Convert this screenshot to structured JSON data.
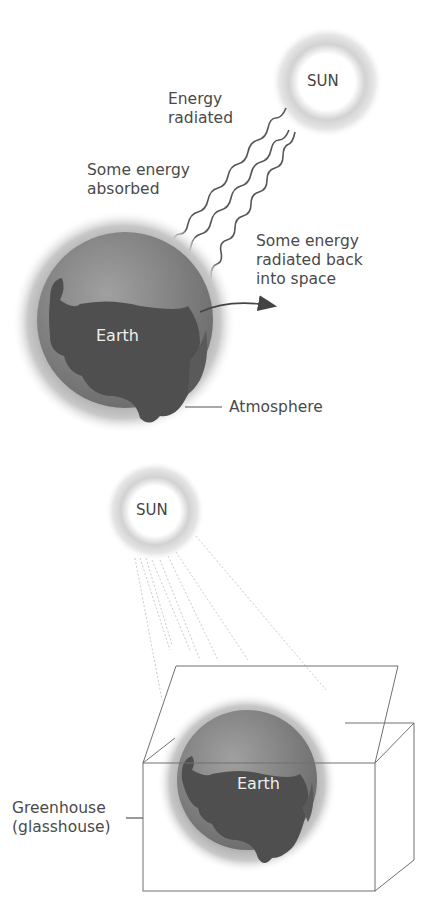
{
  "top_diagram": {
    "sun_label": "SUN",
    "energy_radiated_label": "Energy\nradiated",
    "energy_absorbed_label": "Some energy\nabsorbed",
    "radiated_back_label": "Some energy\nradiated back\ninto space",
    "earth_label": "Earth",
    "atmosphere_label": "Atmosphere"
  },
  "bottom_diagram": {
    "sun_label": "SUN",
    "earth_label": "Earth",
    "greenhouse_label": "Greenhouse\n(glasshouse)"
  },
  "colors": {
    "line": "#555555",
    "earth_dark": "#4a4a4a",
    "earth_light": "#8a8a8a",
    "glow": "#bdbdbd"
  }
}
